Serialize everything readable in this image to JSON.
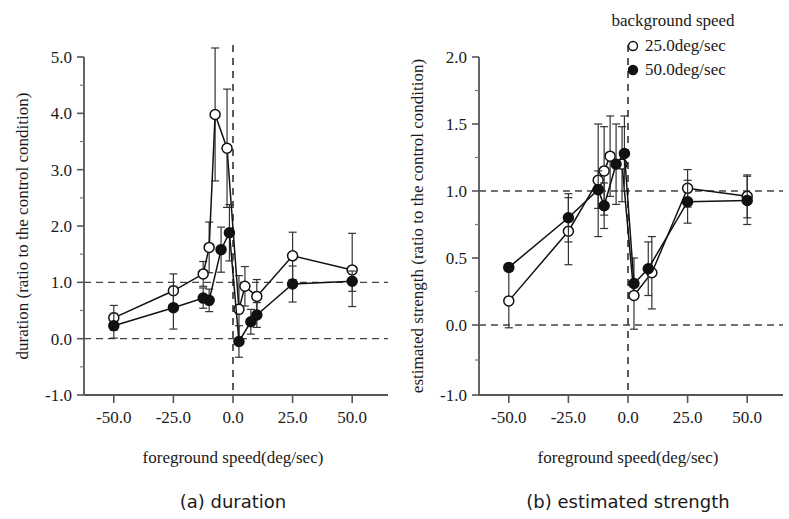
{
  "figure": {
    "legend": {
      "title": "background speed",
      "items": [
        {
          "marker": "open-circle",
          "label": "25.0deg/sec"
        },
        {
          "marker": "filled-circle",
          "label": "50.0deg/sec"
        }
      ]
    }
  },
  "chart_data": [
    {
      "type": "line",
      "panel": "a",
      "title": "(a)  duration",
      "xlabel": "foreground speed(deg/sec)",
      "ylabel": "duration (ratio to the control condition)",
      "xlim": [
        -62.5,
        62.5
      ],
      "ylim": [
        -1.0,
        5.0
      ],
      "xticks": [
        -50.0,
        -25.0,
        0.0,
        25.0,
        50.0
      ],
      "xticklabels": [
        "-50.0",
        "-25.0",
        "0.0",
        "25.0",
        "50.0"
      ],
      "yticks": [
        -1.0,
        0.0,
        1.0,
        2.0,
        3.0,
        4.0,
        5.0
      ],
      "yticklabels": [
        "-1.0",
        "0.0",
        "1.0",
        "2.0",
        "3.0",
        "4.0",
        "5.0"
      ],
      "minor_yticks": [
        -0.5,
        0.5,
        1.5,
        2.5,
        3.5,
        4.5
      ],
      "grid": false,
      "reference_lines": [
        {
          "orient": "h",
          "value": 1.0,
          "style": "dashed"
        },
        {
          "orient": "h",
          "value": 0.0,
          "style": "dashed"
        },
        {
          "orient": "v",
          "value": 0.0,
          "style": "dashed"
        }
      ],
      "legend_position": "outside-upper-right",
      "series": [
        {
          "name": "25.0deg/sec",
          "marker": "open-circle",
          "x": [
            -50.0,
            -25.0,
            -12.5,
            -10.0,
            -7.5,
            -2.5,
            2.5,
            5.0,
            10.0,
            25.0,
            50.0
          ],
          "values": [
            0.37,
            0.85,
            1.15,
            1.62,
            3.98,
            3.38,
            0.52,
            0.93,
            0.75,
            1.47,
            1.22
          ],
          "err": [
            0.22,
            0.3,
            0.22,
            0.45,
            1.18,
            1.05,
            0.6,
            0.35,
            0.3,
            0.42,
            0.65
          ]
        },
        {
          "name": "50.0deg/sec",
          "marker": "filled-circle",
          "x": [
            -50.0,
            -25.0,
            -12.5,
            -10.0,
            -5.0,
            -1.5,
            2.5,
            7.5,
            10.0,
            25.0,
            50.0
          ],
          "values": [
            0.23,
            0.55,
            0.72,
            0.68,
            1.58,
            1.88,
            -0.05,
            0.3,
            0.42,
            0.97,
            1.02
          ],
          "err": [
            0.22,
            0.38,
            0.18,
            0.2,
            0.4,
            0.5,
            0.28,
            0.22,
            0.22,
            0.32,
            0.18
          ]
        }
      ]
    },
    {
      "type": "line",
      "panel": "b",
      "title": "(b)  estimated strength",
      "xlabel": "foreground speed(deg/sec)",
      "ylabel": "estimated strength (ratio to the control condition)",
      "xlim": [
        -62.5,
        62.5
      ],
      "ylim": [
        -1.0,
        2.0
      ],
      "xticks": [
        -50.0,
        -25.0,
        0.0,
        25.0,
        50.0
      ],
      "xticklabels": [
        "-50.0",
        "-25.0",
        "0.0",
        "25.0",
        "50.0"
      ],
      "yticks": [
        -1.0,
        0.0,
        0.5,
        1.0,
        1.5,
        2.0
      ],
      "yticklabels": [
        "-1.0",
        "0.0",
        "0.5",
        "1.0",
        "1.5",
        "2.0"
      ],
      "minor_yticks": [
        -0.5,
        0.25,
        0.75,
        1.25,
        1.75
      ],
      "grid": false,
      "reference_lines": [
        {
          "orient": "h",
          "value": 1.0,
          "style": "dashed"
        },
        {
          "orient": "h",
          "value": 0.0,
          "style": "dashed"
        },
        {
          "orient": "v",
          "value": 0.0,
          "style": "dashed"
        }
      ],
      "legend_position": "upper-right",
      "series": [
        {
          "name": "25.0deg/sec",
          "marker": "open-circle",
          "x": [
            -50.0,
            -25.0,
            -12.5,
            -10.0,
            -7.5,
            -2.5,
            2.5,
            10.0,
            25.0,
            50.0
          ],
          "values": [
            0.18,
            0.7,
            1.08,
            1.15,
            1.26,
            1.2,
            0.22,
            0.39,
            1.02,
            0.96
          ],
          "err": [
            0.22,
            0.25,
            0.42,
            0.33,
            0.3,
            0.28,
            0.28,
            0.27,
            0.14,
            0.16
          ]
        },
        {
          "name": "50.0deg/sec",
          "marker": "filled-circle",
          "x": [
            -50.0,
            -25.0,
            -12.5,
            -10.0,
            -5.0,
            -1.5,
            2.5,
            8.5,
            25.0,
            50.0
          ],
          "values": [
            0.43,
            0.8,
            1.01,
            0.89,
            1.2,
            1.28,
            0.31,
            0.42,
            0.92,
            0.93
          ],
          "err": [
            0.0,
            0.18,
            0.14,
            0.17,
            0.3,
            0.28,
            0.0,
            0.2,
            0.16,
            0.18
          ]
        }
      ]
    }
  ]
}
